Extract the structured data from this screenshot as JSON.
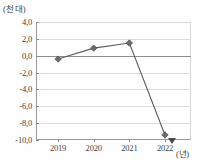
{
  "chart_data": {
    "type": "line",
    "title": "",
    "subtitle": "",
    "xlabel": "(년)",
    "ylabel": "(천 대)",
    "categories": [
      "2019",
      "2020",
      "2021",
      "2022"
    ],
    "values": [
      -0.4,
      0.9,
      1.5,
      -9.4
    ],
    "series": [
      {
        "name": "",
        "values": [
          -0.4,
          0.9,
          1.5,
          -9.4
        ]
      }
    ],
    "ylim": [
      -10.0,
      4.0
    ],
    "ytick_labels": [
      "4,0",
      "2,0",
      "0,0",
      "-2,0",
      "-4,0",
      "-6,0",
      "-8,0",
      "-10,0"
    ],
    "ytick_values": [
      4.0,
      2.0,
      0.0,
      -2.0,
      -4.0,
      -6.0,
      -8.0,
      -10.0
    ],
    "xtick_labels": [
      "2019",
      "2020",
      "2021",
      "2022"
    ],
    "grid": true,
    "legend": "none",
    "marker": "diamond",
    "line_color": "#5a5a5a",
    "marker_color": "#6b6b6b",
    "grid_color": "#dcdcdc",
    "axis_color": "#8f8f8f"
  },
  "axis": {
    "y_unit_label": "(천 대)",
    "x_unit_label": "(년)"
  }
}
